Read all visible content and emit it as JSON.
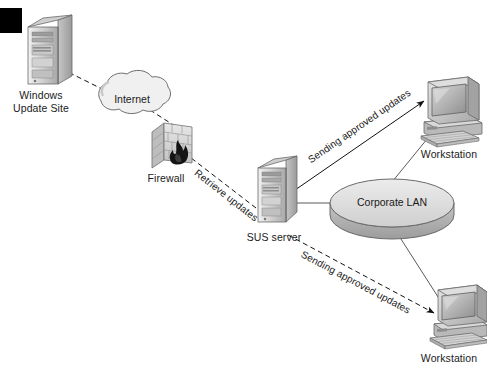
{
  "figure": {
    "type": "network-diagram",
    "background_color": "#ffffff",
    "ink_color": "#1a1a1a",
    "fill_light": "#dcdcdc",
    "fill_mid": "#b8b8b8",
    "fill_dark": "#8f8f8f"
  },
  "corner_mark": {
    "name": "black-corner-block",
    "visible": true
  },
  "nodes": {
    "windows_update_site": {
      "label_line1": "Windows",
      "label_line2": "Update Site",
      "icon": "server-tower-icon"
    },
    "internet": {
      "label": "Internet",
      "icon": "cloud-icon"
    },
    "firewall": {
      "label": "Firewall",
      "icon": "brick-wall-flame-icon"
    },
    "sus_server": {
      "label": "SUS server",
      "icon": "server-tower-icon"
    },
    "corporate_lan": {
      "label": "Corporate LAN",
      "icon": "lan-disc-icon"
    },
    "workstation_top": {
      "label": "Workstation",
      "icon": "desktop-computer-icon"
    },
    "workstation_bottom": {
      "label": "Workstation",
      "icon": "desktop-computer-icon"
    }
  },
  "edges": [
    {
      "name": "update-site-to-internet",
      "label": "",
      "style": "dashed",
      "arrow": "to-update-site"
    },
    {
      "name": "internet-to-firewall",
      "label": "",
      "style": "dashed",
      "arrow": "none"
    },
    {
      "name": "sus-to-firewall",
      "label": "Retrieve updates",
      "style": "dashed",
      "arrow": "to-firewall"
    },
    {
      "name": "sus-to-workstation-top",
      "label": "Sending approved updates",
      "style": "solid",
      "arrow": "to-workstation"
    },
    {
      "name": "sus-to-workstation-bottom",
      "label": "Sending approved updates",
      "style": "dashed",
      "arrow": "to-workstation"
    },
    {
      "name": "sus-to-lan",
      "label": "",
      "style": "solid",
      "arrow": "none"
    },
    {
      "name": "lan-to-workstation-top",
      "label": "",
      "style": "solid",
      "arrow": "none"
    },
    {
      "name": "lan-to-workstation-bottom",
      "label": "",
      "style": "solid",
      "arrow": "none"
    }
  ]
}
